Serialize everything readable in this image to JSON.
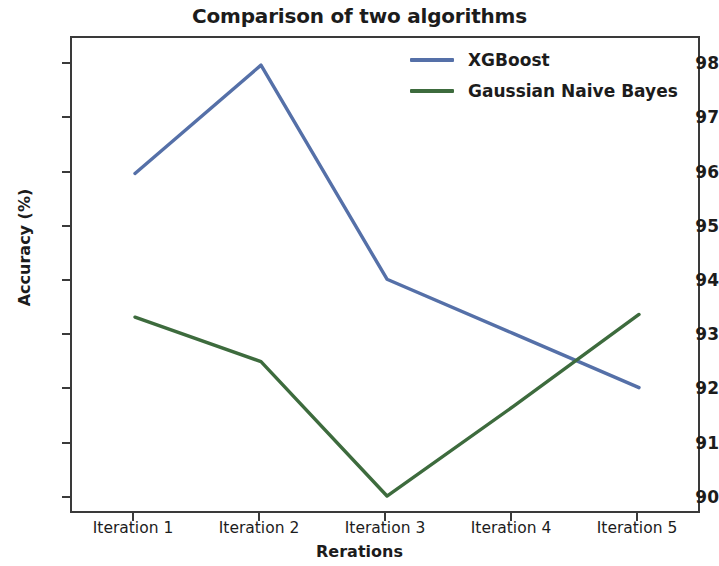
{
  "chart_data": {
    "type": "line",
    "title": "Comparison of two algorithms",
    "xlabel": "Rerations",
    "ylabel": "Accuracy (%)",
    "categories": [
      "Iteration 1",
      "Iteration 2",
      "Iteration 3",
      "Iteration 4",
      "Iteration 5"
    ],
    "ylim": [
      89.7,
      98.5
    ],
    "yticks": [
      90,
      91,
      92,
      93,
      94,
      95,
      96,
      97,
      98
    ],
    "ytick_labels": [
      "90",
      "91",
      "92",
      "93",
      "94",
      "95",
      "96",
      "97",
      "98"
    ],
    "grid": false,
    "legend_position": "upper right",
    "legend_frame": false,
    "series": [
      {
        "name": "XGBoost",
        "color": "#5570a8",
        "values": [
          96.0,
          98.0,
          94.05,
          93.05,
          92.05
        ]
      },
      {
        "name": "Gaussian Naive Bayes",
        "color": "#3d6b3d",
        "values": [
          93.35,
          92.53,
          90.05,
          91.7,
          93.4
        ]
      }
    ]
  },
  "figure": {
    "background": "#ffffff",
    "axes_color": "#3a3a3a",
    "text_color": "#1c1c1c"
  }
}
